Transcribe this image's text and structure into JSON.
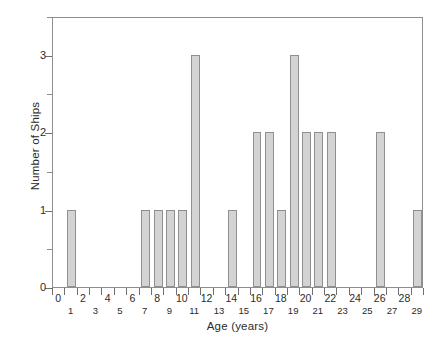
{
  "chart_data": {
    "type": "bar",
    "title": "",
    "xlabel": "Age (years)",
    "ylabel": "Number of Ships",
    "categories": [
      0,
      1,
      2,
      3,
      4,
      5,
      6,
      7,
      8,
      9,
      10,
      11,
      12,
      13,
      14,
      15,
      16,
      17,
      18,
      19,
      20,
      21,
      22,
      23,
      24,
      25,
      26,
      27,
      28,
      29
    ],
    "values": [
      0,
      1,
      0,
      0,
      0,
      0,
      0,
      1,
      1,
      1,
      1,
      3,
      0,
      0,
      1,
      0,
      2,
      2,
      1,
      3,
      2,
      2,
      2,
      0,
      0,
      0,
      2,
      0,
      0,
      1
    ],
    "xlim": [
      -0.5,
      29.5
    ],
    "ylim": [
      0,
      3.5
    ],
    "y_major_ticks": [
      0,
      1,
      2,
      3
    ],
    "y_minor_ticks": [
      0.5,
      1.5,
      2.5,
      3.5
    ],
    "y_tick_labels": [
      "0",
      "1",
      "2",
      "3"
    ],
    "x_tick_labels_even": [
      "0",
      "2",
      "4",
      "6",
      "8",
      "10",
      "12",
      "14",
      "16",
      "18",
      "20",
      "22",
      "24",
      "26",
      "28"
    ],
    "x_tick_labels_odd": [
      "1",
      "3",
      "5",
      "7",
      "9",
      "11",
      "13",
      "15",
      "17",
      "19",
      "21",
      "23",
      "25",
      "27",
      "29"
    ],
    "grid": false,
    "legend": "none",
    "bar_fill_color": "#d3d3d3",
    "bar_edge_color": "#909090",
    "axis_color": "#8e8e8e"
  }
}
